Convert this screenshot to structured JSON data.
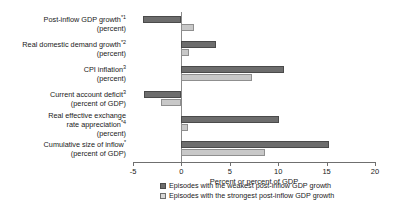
{
  "chart_data": {
    "type": "bar",
    "orientation": "horizontal",
    "title": "",
    "xlabel": "Percent or percent of GDP",
    "ylabel": "",
    "xlim": [
      -5,
      20
    ],
    "xticks": [
      -5,
      0,
      5,
      10,
      15,
      20
    ],
    "xtick_labels": [
      "-5",
      "0",
      "5",
      "10",
      "15",
      "20"
    ],
    "grid": false,
    "legend_position": "bottom",
    "categories": [
      {
        "label": "Post-inflow GDP growth",
        "superscript": "*1",
        "unit": "(percent)"
      },
      {
        "label": "Real domestic demand growth",
        "superscript": "*2",
        "unit": "(percent)"
      },
      {
        "label": "CPI inflation",
        "superscript": "3",
        "unit": "(percent)"
      },
      {
        "label": "Current account deficit",
        "superscript": "3",
        "unit": "(percent of GDP)"
      },
      {
        "label": "Real effective exchange rate appreciation",
        "superscript": "*4",
        "unit": "(percent)"
      },
      {
        "label": "Cumulative size of inflow",
        "superscript": "*",
        "unit": "(percent of GDP)"
      }
    ],
    "series": [
      {
        "name": "Episodes with the weakest post-inflow GDP growth",
        "color": "#6d6d6d",
        "values": [
          -4.0,
          3.6,
          10.6,
          -3.9,
          10.1,
          15.3
        ]
      },
      {
        "name": "Episodes with the strongest post-inflow GDP growth",
        "color": "#c8c8c8",
        "values": [
          1.3,
          0.8,
          7.3,
          -2.1,
          0.7,
          8.6
        ]
      }
    ]
  },
  "legend": {
    "items": [
      "Episodes with the weakest post-inflow GDP growth",
      "Episodes with the strongest post-inflow GDP growth"
    ]
  }
}
